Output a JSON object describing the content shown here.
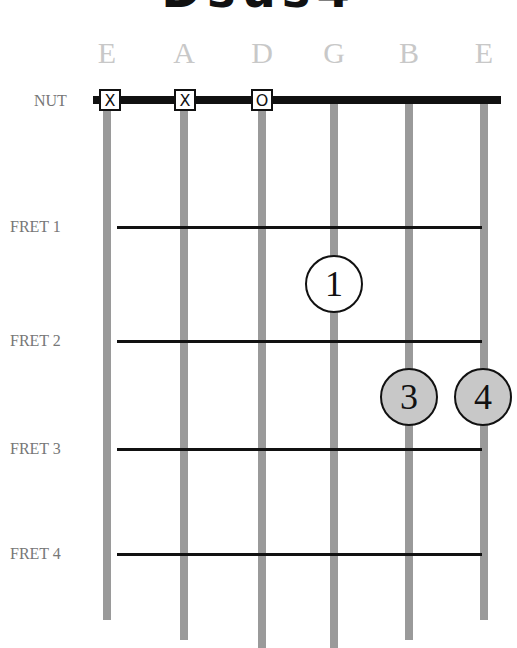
{
  "title": "Dsus4",
  "strings": [
    {
      "name": "E",
      "x": 107,
      "bottom": 620
    },
    {
      "name": "A",
      "x": 184,
      "bottom": 640
    },
    {
      "name": "D",
      "x": 262,
      "bottom": 648
    },
    {
      "name": "G",
      "x": 334,
      "bottom": 648
    },
    {
      "name": "B",
      "x": 409,
      "bottom": 640
    },
    {
      "name": "E",
      "x": 484,
      "bottom": 620
    }
  ],
  "nut_label": "NUT",
  "frets": [
    {
      "label": "FRET 1",
      "y": 227
    },
    {
      "label": "FRET 2",
      "y": 341
    },
    {
      "label": "FRET 3",
      "y": 449
    },
    {
      "label": "FRET 4",
      "y": 554
    }
  ],
  "nut_markers": [
    {
      "string": "E",
      "symbol": "X",
      "x": 110
    },
    {
      "string": "A",
      "symbol": "X",
      "x": 185
    },
    {
      "string": "D",
      "symbol": "O",
      "x": 262
    }
  ],
  "fingers": [
    {
      "number": "1",
      "string": "G",
      "x": 334,
      "y": 284,
      "style": "open"
    },
    {
      "number": "3",
      "string": "B",
      "x": 409,
      "y": 397,
      "style": "filled"
    },
    {
      "number": "4",
      "string": "E",
      "x": 483,
      "y": 397,
      "style": "filled"
    }
  ],
  "colors": {
    "string": "#9a9a9a",
    "fret": "#111111",
    "filled_finger": "#c8c8c8",
    "string_name": "#c8c8c8"
  }
}
